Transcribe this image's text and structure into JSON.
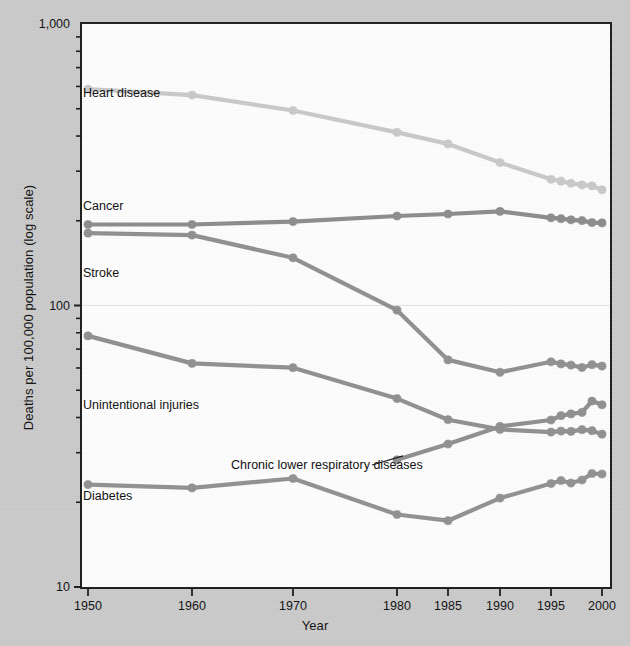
{
  "chart_data": {
    "type": "line",
    "title": "",
    "xlabel": "Year",
    "ylabel": "Deaths per 100,000 population (log scale)",
    "y_scale": "log",
    "ylim": [
      10,
      1000
    ],
    "ytick_labels": [
      "1,000",
      "100",
      "10"
    ],
    "ytick_values": [
      1000,
      100,
      10
    ],
    "xtick_labels": [
      "1950",
      "1960",
      "1970",
      "1980",
      "1985",
      "1990",
      "1995",
      "2000"
    ],
    "xtick_values": [
      1950,
      1960,
      1970,
      1980,
      1985,
      1990,
      1995,
      2000
    ],
    "grid": "horizontal-minor-at-100",
    "legend": "inline-labels",
    "x": [
      1950,
      1960,
      1970,
      1980,
      1985,
      1990,
      1995,
      1996,
      1997,
      1998,
      1999,
      2000
    ],
    "series": [
      {
        "name": "Heart disease",
        "color": "#c9c9c9",
        "label_x": 83,
        "label_y": 86,
        "values": [
          586.8,
          559.0,
          492.7,
          412.1,
          375.0,
          321.8,
          280.7,
          276.4,
          271.6,
          268.2,
          265.9,
          257.6
        ]
      },
      {
        "name": "Cancer",
        "color": "#8c8c8c",
        "label_x": 83,
        "label_y": 199,
        "values": [
          193.9,
          193.9,
          198.6,
          207.9,
          211.3,
          216.0,
          204.9,
          203.4,
          201.6,
          200.3,
          197.0,
          196.5
        ]
      },
      {
        "name": "Stroke",
        "color": "#909090",
        "label_x": 83,
        "label_y": 266,
        "values": [
          180.7,
          177.9,
          147.7,
          96.2,
          64.1,
          57.9,
          63.1,
          62.0,
          61.4,
          60.2,
          61.6,
          60.9
        ]
      },
      {
        "name": "Unintentional injuries",
        "color": "#909090",
        "label_x": 83,
        "label_y": 398,
        "values": [
          78.0,
          62.3,
          60.1,
          46.7,
          39.3,
          36.3,
          35.5,
          35.8,
          35.7,
          36.2,
          35.9,
          34.9
        ]
      },
      {
        "name": "Chronic lower respiratory diseases",
        "color": "#8f8f8f",
        "label_x": 231,
        "label_y": 458,
        "leader": true,
        "values": [
          null,
          null,
          null,
          28.3,
          32.2,
          37.2,
          39.2,
          40.6,
          41.2,
          41.7,
          45.8,
          44.4
        ]
      },
      {
        "name": "Diabetes",
        "color": "#919191",
        "label_x": 83,
        "label_y": 489,
        "values": [
          23.1,
          22.5,
          24.3,
          18.1,
          17.2,
          20.7,
          23.3,
          23.9,
          23.4,
          24.0,
          25.3,
          25.2
        ]
      }
    ]
  },
  "x_axis": {
    "title": "Year"
  },
  "y_axis": {
    "title": "Deaths per 100,000 population (log scale)"
  }
}
